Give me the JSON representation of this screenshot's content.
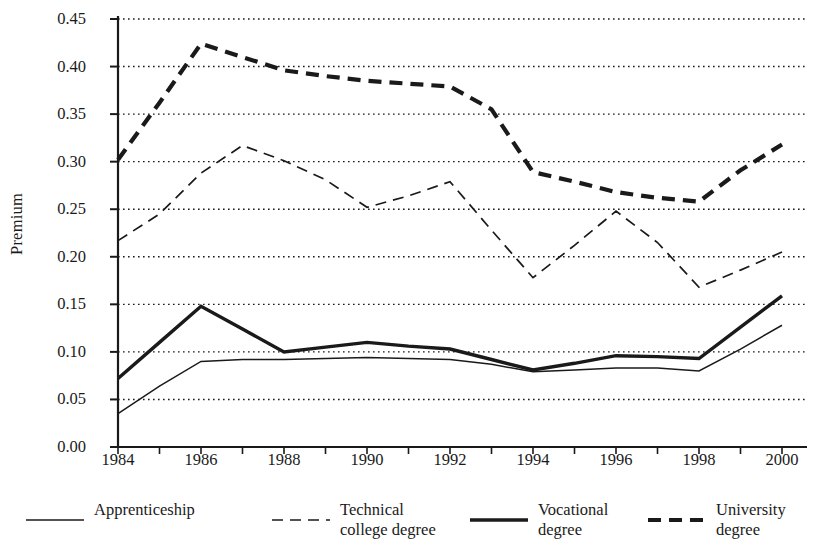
{
  "chart_data": {
    "type": "line",
    "title": "",
    "xlabel": "",
    "ylabel": "Premium",
    "grid": true,
    "legend_position": "bottom",
    "xlim": [
      1984,
      2000
    ],
    "ylim": [
      0.0,
      0.45
    ],
    "ytick_labels": [
      "0.45",
      "0.40",
      "0.35",
      "0.30",
      "0.25",
      "0.20",
      "0.15",
      "0.10",
      "0.05",
      "0.00"
    ],
    "ytick_values": [
      0.45,
      0.4,
      0.35,
      0.3,
      0.25,
      0.2,
      0.15,
      0.1,
      0.05,
      0.0
    ],
    "xtick_labels": [
      "1984",
      "1986",
      "1988",
      "1990",
      "1992",
      "1994",
      "1996",
      "1998",
      "2000"
    ],
    "xtick_values": [
      1984,
      1986,
      1988,
      1990,
      1992,
      1994,
      1996,
      1998,
      2000
    ],
    "x": [
      1984,
      1985,
      1986,
      1987,
      1988,
      1989,
      1990,
      1991,
      1992,
      1993,
      1994,
      1995,
      1996,
      1997,
      1998,
      1999,
      2000
    ],
    "series": [
      {
        "name": "Apprenticeship",
        "style": "thin-solid",
        "color": "#1a1a1a",
        "values": [
          0.035,
          0.064,
          0.09,
          0.092,
          0.092,
          0.093,
          0.094,
          0.093,
          0.092,
          0.087,
          0.079,
          0.081,
          0.083,
          0.083,
          0.08,
          0.103,
          0.128
        ]
      },
      {
        "name": "Technical college degree",
        "style": "thin-dashed",
        "color": "#1a1a1a",
        "values": [
          0.217,
          0.245,
          0.288,
          0.317,
          0.301,
          0.281,
          0.252,
          0.264,
          0.279,
          0.228,
          0.178,
          0.212,
          0.248,
          0.215,
          0.168,
          0.186,
          0.205
        ]
      },
      {
        "name": "Vocational degree",
        "style": "thick-solid",
        "color": "#1a1a1a",
        "values": [
          0.072,
          0.11,
          0.148,
          0.124,
          0.1,
          0.105,
          0.11,
          0.106,
          0.103,
          0.092,
          0.081,
          0.088,
          0.096,
          0.095,
          0.093,
          0.126,
          0.159
        ]
      },
      {
        "name": "University degree",
        "style": "thick-dashed",
        "color": "#1a1a1a",
        "values": [
          0.302,
          0.362,
          0.424,
          0.41,
          0.396,
          0.39,
          0.385,
          0.382,
          0.379,
          0.355,
          0.289,
          0.279,
          0.268,
          0.262,
          0.258,
          0.291,
          0.318
        ]
      }
    ]
  },
  "legend": {
    "items": [
      {
        "label_line1": "Apprenticeship",
        "label_line2": "",
        "style": "thin-solid"
      },
      {
        "label_line1": "Technical",
        "label_line2": "college degree",
        "style": "thin-dashed"
      },
      {
        "label_line1": "Vocational",
        "label_line2": "degree",
        "style": "thick-solid"
      },
      {
        "label_line1": "University",
        "label_line2": "degree",
        "style": "thick-dashed"
      }
    ]
  }
}
